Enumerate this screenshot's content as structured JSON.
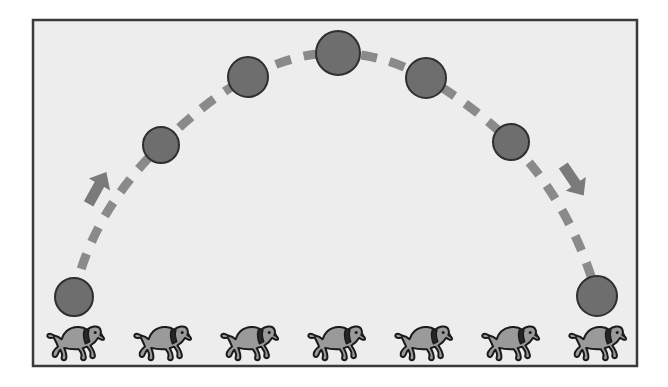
{
  "scene": {
    "title": "Projectile motion arc with running dogs",
    "canvas": {
      "width": 668,
      "height": 387,
      "background_color": "#ffffff"
    },
    "frame": {
      "name": "illustration-frame",
      "x": 33,
      "y": 20,
      "width": 604,
      "height": 346,
      "fill_color": "#ededed",
      "border_color": "#3a3a3a",
      "border_width": 2.5
    },
    "ball": {
      "fill_color": "#6e6e6e",
      "stroke_color": "#2f2f2f",
      "stroke_width": 2
    },
    "balls": [
      {
        "label": "ball-1-launch",
        "cx": 74,
        "cy": 297,
        "r": 19
      },
      {
        "label": "ball-2-rising",
        "cx": 161,
        "cy": 145,
        "r": 18
      },
      {
        "label": "ball-3-rising",
        "cx": 248,
        "cy": 77,
        "r": 20
      },
      {
        "label": "ball-4-apex",
        "cx": 338,
        "cy": 53,
        "r": 22
      },
      {
        "label": "ball-5-falling",
        "cx": 426,
        "cy": 78,
        "r": 20
      },
      {
        "label": "ball-6-falling",
        "cx": 511,
        "cy": 142,
        "r": 18
      },
      {
        "label": "ball-7-landing",
        "cx": 597,
        "cy": 296,
        "r": 20
      }
    ],
    "trajectory": {
      "name": "trajectory-dashed-path",
      "color": "#8a8a8a",
      "stroke_width": 9,
      "dash_pattern": "16 13",
      "path": "M 74 297 Q 90 215 161 145 Q 205 101 248 77 Q 295 52 338 53 Q 385 54 426 78 Q 470 103 511 142 Q 572 205 597 296"
    },
    "arrows": [
      {
        "label": "arrow-up-ascending",
        "direction": "up-right",
        "color": "#7a7a7a",
        "tail_x": 88,
        "tail_y": 205,
        "head_x": 107,
        "head_y": 171
      },
      {
        "label": "arrow-down-descending",
        "direction": "down-right",
        "color": "#7a7a7a",
        "tail_x": 563,
        "tail_y": 165,
        "head_x": 584,
        "head_y": 196
      }
    ],
    "dog": {
      "body_color": "#9a9a9a",
      "outline_color": "#1a1a1a",
      "collar_color": "#262626",
      "outline_width": 2,
      "width": 62,
      "height": 42,
      "facing": "right",
      "pose": "running"
    },
    "dogs": [
      {
        "label": "dog-1",
        "x": 44,
        "y": 322
      },
      {
        "label": "dog-2",
        "x": 131,
        "y": 322
      },
      {
        "label": "dog-3",
        "x": 218,
        "y": 322
      },
      {
        "label": "dog-4",
        "x": 305,
        "y": 322
      },
      {
        "label": "dog-5",
        "x": 392,
        "y": 322
      },
      {
        "label": "dog-6",
        "x": 479,
        "y": 322
      },
      {
        "label": "dog-7",
        "x": 566,
        "y": 322
      }
    ]
  }
}
